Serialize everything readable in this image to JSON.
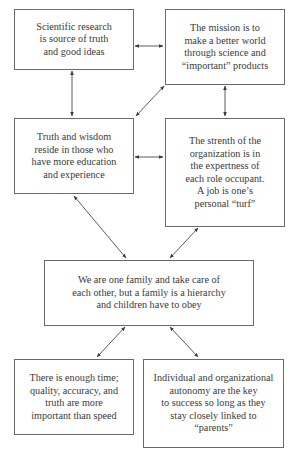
{
  "diagram": {
    "boxes": [
      {
        "id": "research",
        "text": "Scientific research\nis source of truth\nand good ideas"
      },
      {
        "id": "mission",
        "text": "The mission is to\nmake a better world\nthrough science and\n“important” products"
      },
      {
        "id": "wisdom",
        "text": "Truth and wisdom\nreside in those who\nhave more education\nand experience"
      },
      {
        "id": "strength",
        "text": "The strenth of the\norganization is in\nthe expertness of\neach role occupant.\nA job is one’s\npersonal “turf”"
      },
      {
        "id": "family",
        "text": "We are one family and take care of\neach other, but a family is a hierarchy\nand children have to obey"
      },
      {
        "id": "time",
        "text": "There is enough time;\nquality, accuracy, and\ntruth are more\nimportant than speed"
      },
      {
        "id": "autonomy",
        "text": "Individual and organizational\nautonomy are the key\nto success so long as they\nstay closely linked to\n“parents”"
      }
    ],
    "connections": [
      {
        "from": "research",
        "to": "mission",
        "type": "bidirectional"
      },
      {
        "from": "research",
        "to": "wisdom",
        "type": "bidirectional"
      },
      {
        "from": "mission",
        "to": "wisdom",
        "type": "bidirectional"
      },
      {
        "from": "mission",
        "to": "strength",
        "type": "bidirectional"
      },
      {
        "from": "wisdom",
        "to": "strength",
        "type": "bidirectional"
      },
      {
        "from": "wisdom",
        "to": "family",
        "type": "bidirectional"
      },
      {
        "from": "strength",
        "to": "family",
        "type": "bidirectional"
      },
      {
        "from": "family",
        "to": "time",
        "type": "bidirectional"
      },
      {
        "from": "family",
        "to": "autonomy",
        "type": "bidirectional"
      }
    ]
  }
}
